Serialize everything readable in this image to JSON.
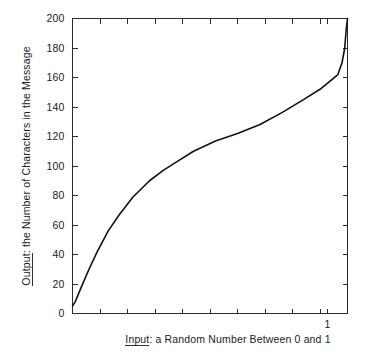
{
  "chart_data": {
    "type": "line",
    "title": "",
    "xlabel": "Input: a Random Number Between 0 and 1",
    "xlabel_underlined_word": "Input",
    "ylabel": "Output: the Number of Characters in the Message",
    "ylabel_underlined_word": "Output",
    "xlim": [
      0,
      1
    ],
    "ylim": [
      0,
      200
    ],
    "grid": false,
    "legend": "none",
    "x_tick_values": [
      0,
      0.1,
      0.2,
      0.3,
      0.4,
      0.5,
      0.6,
      0.7,
      0.8,
      0.9,
      1
    ],
    "x_tick_labels": [
      "",
      "",
      "",
      "",
      "",
      "",
      "",
      "",
      "",
      "",
      "1"
    ],
    "y_tick_values": [
      0,
      20,
      40,
      60,
      80,
      100,
      120,
      140,
      160,
      180,
      200
    ],
    "y_tick_labels": [
      "0",
      "20",
      "40",
      "60",
      "80",
      "100",
      "120",
      "140",
      "160",
      "180",
      "200"
    ],
    "x": [
      0.0,
      0.01,
      0.03,
      0.06,
      0.09,
      0.13,
      0.17,
      0.22,
      0.28,
      0.33,
      0.38,
      0.44,
      0.52,
      0.6,
      0.68,
      0.76,
      0.84,
      0.9,
      0.94,
      0.965,
      0.98,
      0.99,
      0.995,
      1.0
    ],
    "y": [
      5,
      8,
      17,
      30,
      42,
      56,
      67,
      79,
      90,
      97,
      103,
      110,
      117,
      122,
      128,
      136,
      145,
      152,
      158,
      162,
      170,
      180,
      192,
      200
    ],
    "series": [
      {
        "name": "characters-vs-random-number",
        "color": "#111111",
        "x": [
          0.0,
          0.01,
          0.03,
          0.06,
          0.09,
          0.13,
          0.17,
          0.22,
          0.28,
          0.33,
          0.38,
          0.44,
          0.52,
          0.6,
          0.68,
          0.76,
          0.84,
          0.9,
          0.94,
          0.965,
          0.98,
          0.99,
          0.995,
          1.0
        ],
        "y": [
          5,
          8,
          17,
          30,
          42,
          56,
          67,
          79,
          90,
          97,
          103,
          110,
          117,
          122,
          128,
          136,
          145,
          152,
          158,
          162,
          170,
          180,
          192,
          200
        ]
      }
    ]
  },
  "axes": {
    "y_labels": [
      "200",
      "180",
      "160",
      "140",
      "120",
      "100",
      "80",
      "60",
      "40",
      "20",
      "0"
    ],
    "x_labels": [
      "1"
    ]
  },
  "colors": {
    "line": "#111111",
    "frame": "#2b2b2b",
    "text": "#1a1a1a",
    "background": "#ffffff"
  }
}
